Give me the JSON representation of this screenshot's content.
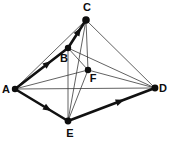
{
  "figure": {
    "width": 169,
    "height": 142,
    "background_color": "#ffffff",
    "line_color": "#111111",
    "thin_line_color": "#3a3a3a",
    "dot_color": "#0d0d0d",
    "label_color": "#0d0d0d"
  },
  "vertices": [
    {
      "id": "A",
      "label": "A",
      "x": 15,
      "y": 89,
      "dot_r": 3.2,
      "label_x": 6,
      "label_y": 93,
      "anchor": "middle"
    },
    {
      "id": "B",
      "label": "B",
      "x": 68,
      "y": 48,
      "dot_r": 3.2,
      "label_x": 64,
      "label_y": 62,
      "anchor": "middle"
    },
    {
      "id": "C",
      "label": "C",
      "x": 86,
      "y": 20,
      "dot_r": 3.8,
      "label_x": 87,
      "label_y": 11,
      "anchor": "middle"
    },
    {
      "id": "D",
      "label": "D",
      "x": 155,
      "y": 88,
      "dot_r": 3.4,
      "label_x": 163,
      "label_y": 92,
      "anchor": "middle"
    },
    {
      "id": "E",
      "label": "E",
      "x": 68,
      "y": 121,
      "dot_r": 3.4,
      "label_x": 70,
      "label_y": 137,
      "anchor": "middle"
    },
    {
      "id": "F",
      "label": "F",
      "x": 88,
      "y": 70,
      "dot_r": 3.2,
      "label_x": 93,
      "label_y": 82,
      "anchor": "middle"
    }
  ],
  "thick_edges": [
    {
      "id": "A-B",
      "from": "A",
      "to": "B",
      "arrow": true,
      "arrow_t": 0.62,
      "width": 2.6
    },
    {
      "id": "B-C",
      "from": "B",
      "to": "C",
      "arrow": true,
      "arrow_t": 0.6,
      "width": 2.6
    },
    {
      "id": "A-E",
      "from": "A",
      "to": "E",
      "arrow": true,
      "arrow_t": 0.62,
      "width": 2.6
    },
    {
      "id": "E-D",
      "from": "E",
      "to": "D",
      "arrow": true,
      "arrow_t": 0.6,
      "width": 2.6
    }
  ],
  "thin_edges": [
    {
      "id": "A-C",
      "from": "A",
      "to": "C",
      "width": 0.8
    },
    {
      "id": "A-D",
      "from": "A",
      "to": "D",
      "width": 0.8
    },
    {
      "id": "A-F",
      "from": "A",
      "to": "F",
      "width": 0.8
    },
    {
      "id": "A-B-thin",
      "from": "A",
      "to": "B",
      "width": 0.8
    },
    {
      "id": "C-D",
      "from": "C",
      "to": "D",
      "width": 0.8
    },
    {
      "id": "C-E",
      "from": "C",
      "to": "E",
      "width": 0.8
    },
    {
      "id": "C-F",
      "from": "C",
      "to": "F",
      "width": 0.8
    },
    {
      "id": "B-D",
      "from": "B",
      "to": "D",
      "width": 0.8
    },
    {
      "id": "B-E",
      "from": "B",
      "to": "E",
      "width": 0.8
    },
    {
      "id": "B-F",
      "from": "B",
      "to": "F",
      "width": 0.8
    },
    {
      "id": "F-D",
      "from": "F",
      "to": "D",
      "width": 0.8
    },
    {
      "id": "F-E",
      "from": "F",
      "to": "E",
      "width": 0.8
    },
    {
      "id": "E-D-thin",
      "from": "E",
      "to": "D",
      "width": 0.8
    },
    {
      "id": "C-B-thin",
      "from": "C",
      "to": "B",
      "width": 0.8
    }
  ],
  "chart_data": {
    "type": "diagram",
    "nodes": [
      "A",
      "B",
      "C",
      "D",
      "E",
      "F"
    ],
    "directed_edges": [
      {
        "from": "A",
        "to": "B"
      },
      {
        "from": "B",
        "to": "C"
      },
      {
        "from": "A",
        "to": "E"
      },
      {
        "from": "E",
        "to": "D"
      }
    ],
    "undirected_edges": [
      {
        "from": "A",
        "to": "C"
      },
      {
        "from": "A",
        "to": "D"
      },
      {
        "from": "A",
        "to": "F"
      },
      {
        "from": "C",
        "to": "D"
      },
      {
        "from": "C",
        "to": "E"
      },
      {
        "from": "C",
        "to": "F"
      },
      {
        "from": "B",
        "to": "D"
      },
      {
        "from": "B",
        "to": "E"
      },
      {
        "from": "B",
        "to": "F"
      },
      {
        "from": "F",
        "to": "D"
      },
      {
        "from": "F",
        "to": "E"
      },
      {
        "from": "E",
        "to": "D"
      }
    ]
  }
}
